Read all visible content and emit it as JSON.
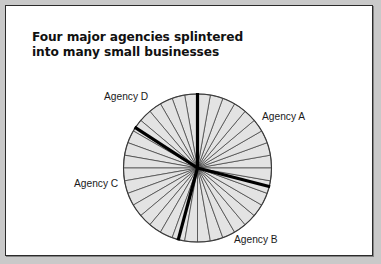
{
  "window": {
    "background_color": "#c9c9c9",
    "panel_color": "#ffffff",
    "border_color": "#2b2b2b"
  },
  "title": {
    "text": "Four major agencies splintered\ninto many small businesses",
    "line1": "Four major agencies splintered",
    "line2": "into many small businesses",
    "color": "#111111"
  },
  "labels": {
    "agency_a": "Agency A",
    "agency_b": "Agency B",
    "agency_c": "Agency C",
    "agency_d": "Agency D"
  },
  "chart_data": {
    "type": "pie",
    "title": "Four major agencies splintered into many small businesses",
    "subtitle": "",
    "xlabel": "",
    "ylabel": "",
    "legend_position": "annotations-around-pie",
    "grid": false,
    "center": {
      "x": 191.5,
      "y": 162
    },
    "radius": 74,
    "slice_fill_color": "#e3e3e3",
    "slice_stroke_color": "#3a3a3a",
    "slice_stroke_width": 0.7,
    "divider_color": "#000000",
    "divider_width": 3.2,
    "small_business_slice_count": 36,
    "small_business_slice_degrees": 10,
    "values": [
      25,
      25,
      25,
      25
    ],
    "categories": [
      "Agency A",
      "Agency B",
      "Agency C",
      "Agency D"
    ],
    "groups": [
      {
        "name": "Agency A",
        "label": "Agency A",
        "start_angle_deg": -14.5,
        "end_angle_deg": 90,
        "share_pct": 29,
        "label_position": {
          "x": 256,
          "y": 105
        }
      },
      {
        "name": "Agency B",
        "label": "Agency B",
        "start_angle_deg": -105,
        "end_angle_deg": -14.5,
        "share_pct": 25,
        "label_position": {
          "x": 228,
          "y": 228
        }
      },
      {
        "name": "Agency C",
        "label": "Agency C",
        "start_angle_deg": -105,
        "end_angle_deg": 147,
        "share_pct": 29,
        "label_position": {
          "x": 68,
          "y": 172
        }
      },
      {
        "name": "Agency D",
        "label": "Agency D",
        "start_angle_deg": 90,
        "end_angle_deg": 147,
        "share_pct": 16,
        "label_position": {
          "x": 98,
          "y": 85
        }
      }
    ],
    "dividers_deg": [
      90,
      147,
      255,
      345.5
    ],
    "annotations": [
      "Agency A",
      "Agency B",
      "Agency C",
      "Agency D"
    ]
  }
}
